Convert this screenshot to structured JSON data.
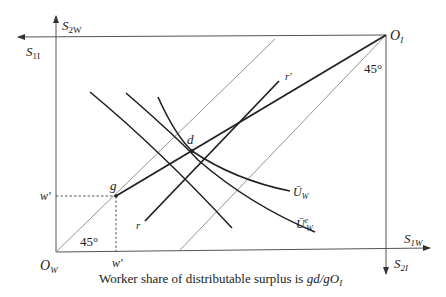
{
  "diagram": {
    "type": "edgeworth-box",
    "axes": {
      "worker_origin": "O",
      "worker_origin_sub": "W",
      "investor_origin": "O",
      "investor_origin_sub": "I",
      "s1w": {
        "main": "S",
        "sub": "1W"
      },
      "s2w": {
        "main": "S",
        "sub": "2W"
      },
      "s1i": {
        "main": "S",
        "sub": "1I"
      },
      "s2i": {
        "main": "S",
        "sub": "2I"
      }
    },
    "angles": {
      "worker": "45°",
      "investor": "45°"
    },
    "points": {
      "g": "g",
      "d": "d"
    },
    "lines": {
      "r_low": "r",
      "r_high": "r'"
    },
    "curves": {
      "uw": {
        "main": "Ū",
        "sub": "W"
      },
      "uwe": {
        "main": "Ū",
        "sup": "e",
        "sub": "W"
      }
    },
    "ticks": {
      "w_prime_y": "w'",
      "w_prime_x": "w'"
    },
    "caption": {
      "text": "Worker share of distributable surplus is ",
      "formula": "gd/gO",
      "formula_sub": "I"
    }
  }
}
